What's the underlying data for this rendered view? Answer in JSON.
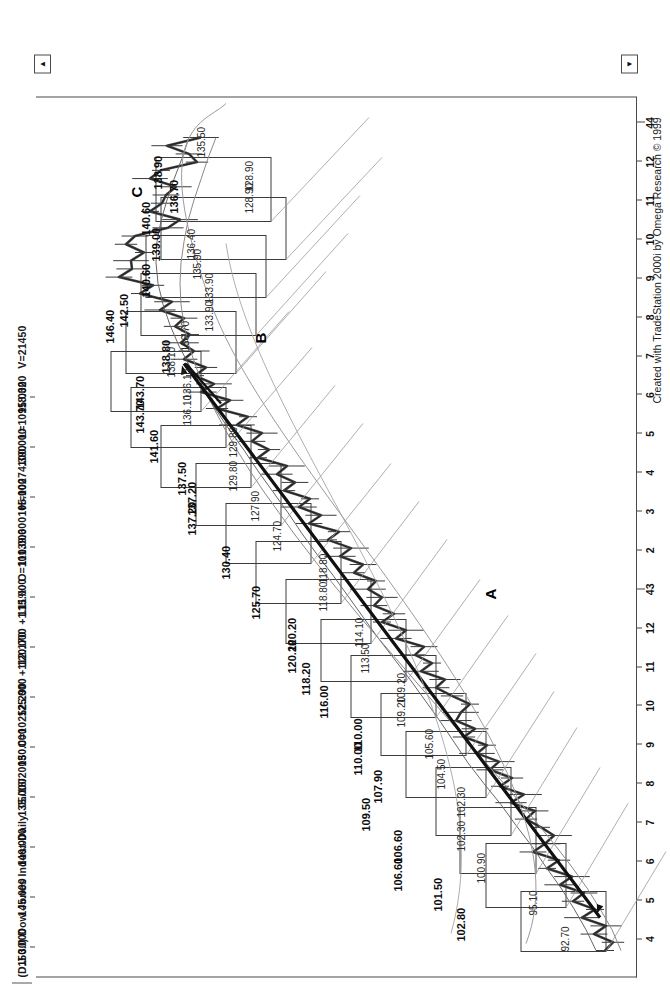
{
  "window": {
    "symbol": "(D.J 30) Dow Jones Indust-Daily",
    "date": "05/16/2005",
    "close": "C=10252.290",
    "change": "+112.170",
    "change_pct": "+1.11%",
    "open": "O=10139.600",
    "high": "H=10274.390",
    "low": "L=10118.320",
    "volume": "V=21450",
    "copyright": "Created with TradeStation 2000i by Omega Research © 1999",
    "scroll_up": "▲",
    "scroll_down": "▼"
  },
  "chart_data": {
    "type": "line",
    "title": "(D.J 30) Dow Jones Indust-Daily",
    "xlabel": "",
    "ylabel": "",
    "grid": false,
    "legend": "none",
    "ylim": [
      92.0,
      152.0
    ],
    "y_ticks": [
      "150.000",
      "145.000",
      "140.000",
      "135.000",
      "130.000",
      "125.000",
      "120.000",
      "115.000",
      "110.000",
      "105.000",
      "100.000",
      "95.000"
    ],
    "x_ticks": [
      "4",
      "5",
      "6",
      "7",
      "8",
      "9",
      "10",
      "11",
      "12",
      "43",
      "2",
      "3",
      "4",
      "5",
      "6",
      "7",
      "8",
      "9",
      "10",
      "11",
      "12",
      "44"
    ],
    "series": [
      {
        "name": "price",
        "x": [
          0,
          1,
          2,
          3,
          4,
          5,
          6,
          7,
          8,
          9,
          10,
          11,
          12,
          13,
          14,
          15,
          16,
          17,
          18,
          19,
          20,
          21,
          22,
          23,
          24,
          25,
          26,
          27,
          28,
          29,
          30,
          31,
          32,
          33,
          34,
          35,
          36,
          37,
          38,
          39,
          40,
          41,
          42,
          43,
          44,
          45,
          46,
          47,
          48,
          49,
          50,
          51,
          52,
          53,
          54,
          55,
          56,
          57,
          58,
          59,
          60,
          61,
          62,
          63,
          64,
          65,
          66,
          67,
          68,
          69,
          70,
          71,
          72,
          73,
          74,
          75,
          76,
          77,
          78,
          79,
          80,
          81,
          82,
          83,
          84,
          85,
          86,
          87,
          88,
          89,
          90,
          91,
          92,
          93,
          94,
          95,
          96,
          97,
          98,
          99
        ],
        "values": [
          95.1,
          94.3,
          96.2,
          95.0,
          97.4,
          96.1,
          98.3,
          97.2,
          99.6,
          98.4,
          100.9,
          99.7,
          102.3,
          101.1,
          100.2,
          101.5,
          103.0,
          102.1,
          104.5,
          103.2,
          105.6,
          104.4,
          106.6,
          105.7,
          107.9,
          106.9,
          109.2,
          108.1,
          110.0,
          109.5,
          108.6,
          110.4,
          112.0,
          111.1,
          113.5,
          112.4,
          114.1,
          113.2,
          116.0,
          115.0,
          117.4,
          116.2,
          118.2,
          117.4,
          118.8,
          118.0,
          120.2,
          119.3,
          121.6,
          120.5,
          122.8,
          121.7,
          124.7,
          123.5,
          125.7,
          124.6,
          127.2,
          126.1,
          127.9,
          126.9,
          129.8,
          128.7,
          130.4,
          129.4,
          131.9,
          130.8,
          133.9,
          132.6,
          135.5,
          134.2,
          136.1,
          135.0,
          137.2,
          136.2,
          137.5,
          136.6,
          138.1,
          137.2,
          139.6,
          138.4,
          141.6,
          140.3,
          143.7,
          142.4,
          142.5,
          141.2,
          143.0,
          142.1,
          138.8,
          137.6,
          140.6,
          139.4,
          139.0,
          138.0,
          140.6,
          139.5,
          135.9,
          136.7,
          138.9,
          135.5
        ]
      },
      {
        "name": "fast-ma",
        "values": [
          96.0,
          97.0,
          98.2,
          99.5,
          101.0,
          102.4,
          104.0,
          105.5,
          107.2,
          108.8,
          110.2,
          111.6,
          113.1,
          114.6,
          116.2,
          117.8,
          119.3,
          120.8,
          122.3,
          123.9,
          125.4,
          126.8,
          128.3,
          129.8,
          131.2,
          132.7,
          134.1,
          135.4,
          136.6,
          137.7,
          138.6,
          139.3,
          139.8,
          140.0,
          139.9,
          139.5,
          138.9,
          138.2,
          137.4,
          136.7
        ]
      },
      {
        "name": "slow-ma",
        "values": [
          93.5,
          94.4,
          95.6,
          96.9,
          98.4,
          100.0,
          101.7,
          103.4,
          105.2,
          107.0,
          108.8,
          110.6,
          112.4,
          114.2,
          116.0,
          117.8,
          119.6,
          121.3,
          123.0,
          124.6,
          126.2,
          127.7,
          129.2,
          130.6,
          131.9,
          133.1,
          134.2,
          135.2,
          136.0,
          136.7,
          137.2,
          137.5,
          137.6,
          137.5,
          137.2,
          136.8,
          136.2,
          135.5,
          134.8,
          134.0
        ]
      }
    ],
    "box_labels": [
      {
        "text": "102.80"
      },
      {
        "text": "101.50"
      },
      {
        "text": "106.60"
      },
      {
        "text": "106.60"
      },
      {
        "text": "109.50"
      },
      {
        "text": "107.90"
      },
      {
        "text": "110.00"
      },
      {
        "text": "110.00"
      },
      {
        "text": "116.00"
      },
      {
        "text": "118.20"
      },
      {
        "text": "120.20"
      },
      {
        "text": "120.20"
      },
      {
        "text": "125.70"
      },
      {
        "text": "130.40"
      },
      {
        "text": "137.20"
      },
      {
        "text": "137.20"
      },
      {
        "text": "137.50"
      },
      {
        "text": "141.60"
      },
      {
        "text": "143.70"
      },
      {
        "text": "143.70"
      },
      {
        "text": "138.80"
      },
      {
        "text": "146.40"
      },
      {
        "text": "142.50"
      },
      {
        "text": "140.60"
      },
      {
        "text": "139.00"
      },
      {
        "text": "140.60"
      },
      {
        "text": "136.70"
      },
      {
        "text": "138.90"
      }
    ],
    "level_labels": [
      {
        "text": "92.70"
      },
      {
        "text": "95.10"
      },
      {
        "text": "100.90"
      },
      {
        "text": "102.30"
      },
      {
        "text": "102.30"
      },
      {
        "text": "104.50"
      },
      {
        "text": "105.60"
      },
      {
        "text": "109.20"
      },
      {
        "text": "109.20"
      },
      {
        "text": "113.50"
      },
      {
        "text": "114.10"
      },
      {
        "text": "118.80"
      },
      {
        "text": "118.80"
      },
      {
        "text": "124.70"
      },
      {
        "text": "127.90"
      },
      {
        "text": "129.80"
      },
      {
        "text": "129.80"
      },
      {
        "text": "136.10"
      },
      {
        "text": "136.10"
      },
      {
        "text": "138.10"
      },
      {
        "text": "136.70"
      },
      {
        "text": "133.90"
      },
      {
        "text": "133.90"
      },
      {
        "text": "135.90"
      },
      {
        "text": "136.40"
      },
      {
        "text": "128.90"
      },
      {
        "text": "128.90"
      },
      {
        "text": "135.50"
      }
    ],
    "annotations": [
      {
        "label": "A",
        "note": "lower trendline pivot"
      },
      {
        "label": "B",
        "note": "mid trendline pivot"
      },
      {
        "label": "C",
        "note": "upper consolidation"
      }
    ]
  },
  "price_axis": [
    {
      "value": "150.000"
    },
    {
      "value": "145.000"
    },
    {
      "value": "140.000"
    },
    {
      "value": "135.000"
    },
    {
      "value": "130.000"
    },
    {
      "value": "125.000"
    },
    {
      "value": "120.000"
    },
    {
      "value": "115.000"
    },
    {
      "value": "110.000"
    },
    {
      "value": "105.000"
    },
    {
      "value": "100.000"
    },
    {
      "value": "95.000"
    }
  ],
  "date_axis": [
    {
      "label": "4"
    },
    {
      "label": "5"
    },
    {
      "label": "6"
    },
    {
      "label": "7"
    },
    {
      "label": "8"
    },
    {
      "label": "9"
    },
    {
      "label": "10"
    },
    {
      "label": "11"
    },
    {
      "label": "12"
    },
    {
      "label": "43"
    },
    {
      "label": "2"
    },
    {
      "label": "3"
    },
    {
      "label": "4"
    },
    {
      "label": "5"
    },
    {
      "label": "6"
    },
    {
      "label": "7"
    },
    {
      "label": "8"
    },
    {
      "label": "9"
    },
    {
      "label": "10"
    },
    {
      "label": "11"
    },
    {
      "label": "12"
    },
    {
      "label": "44"
    }
  ],
  "overlays": {
    "bold_labels": [
      {
        "t": "102.80",
        "x": 62,
        "y": 455
      },
      {
        "t": "101.50",
        "x": 92,
        "y": 432
      },
      {
        "t": "106.60",
        "x": 112,
        "y": 392
      },
      {
        "t": "106.60",
        "x": 140,
        "y": 392
      },
      {
        "t": "109.50",
        "x": 172,
        "y": 360
      },
      {
        "t": "107.90",
        "x": 200,
        "y": 372
      },
      {
        "t": "110.00",
        "x": 228,
        "y": 352
      },
      {
        "t": "110.00",
        "x": 252,
        "y": 352
      },
      {
        "t": "116.00",
        "x": 285,
        "y": 318
      },
      {
        "t": "118.20",
        "x": 308,
        "y": 300
      },
      {
        "t": "120.20",
        "x": 330,
        "y": 286
      },
      {
        "t": "120.20",
        "x": 352,
        "y": 286
      },
      {
        "t": "125.70",
        "x": 384,
        "y": 250
      },
      {
        "t": "130.40",
        "x": 424,
        "y": 220
      },
      {
        "t": "137.20",
        "x": 468,
        "y": 186
      },
      {
        "t": "137.20",
        "x": 488,
        "y": 186
      },
      {
        "t": "137.50",
        "x": 508,
        "y": 176
      },
      {
        "t": "141.60",
        "x": 540,
        "y": 148
      },
      {
        "t": "143.70",
        "x": 570,
        "y": 134
      },
      {
        "t": "143.70",
        "x": 594,
        "y": 134
      },
      {
        "t": "138.80",
        "x": 630,
        "y": 160
      },
      {
        "t": "146.40",
        "x": 660,
        "y": 104
      },
      {
        "t": "142.50",
        "x": 676,
        "y": 118
      },
      {
        "t": "140.60",
        "x": 706,
        "y": 140
      },
      {
        "t": "139.00",
        "x": 742,
        "y": 150
      },
      {
        "t": "140.60",
        "x": 768,
        "y": 140
      },
      {
        "t": "136.70",
        "x": 790,
        "y": 168
      },
      {
        "t": "138.90",
        "x": 814,
        "y": 152
      }
    ],
    "thin_labels": [
      {
        "t": "92.70",
        "x": 52,
        "y": 560
      },
      {
        "t": "95.10",
        "x": 88,
        "y": 528
      },
      {
        "t": "100.90",
        "x": 120,
        "y": 476
      },
      {
        "t": "102.30",
        "x": 152,
        "y": 456
      },
      {
        "t": "102.30",
        "x": 186,
        "y": 456
      },
      {
        "t": "104.50",
        "x": 214,
        "y": 436
      },
      {
        "t": "105.60",
        "x": 244,
        "y": 424
      },
      {
        "t": "109.20",
        "x": 276,
        "y": 396
      },
      {
        "t": "109.20",
        "x": 300,
        "y": 396
      },
      {
        "t": "113.50",
        "x": 330,
        "y": 360
      },
      {
        "t": "114.10",
        "x": 356,
        "y": 354
      },
      {
        "t": "118.80",
        "x": 392,
        "y": 318
      },
      {
        "t": "118.80",
        "x": 420,
        "y": 318
      },
      {
        "t": "124.70",
        "x": 452,
        "y": 272
      },
      {
        "t": "127.90",
        "x": 482,
        "y": 250
      },
      {
        "t": "129.80",
        "x": 512,
        "y": 228
      },
      {
        "t": "129.80",
        "x": 546,
        "y": 228
      },
      {
        "t": "136.10",
        "x": 578,
        "y": 182
      },
      {
        "t": "136.10",
        "x": 604,
        "y": 182
      },
      {
        "t": "138.10",
        "x": 626,
        "y": 166
      },
      {
        "t": "136.70",
        "x": 652,
        "y": 180
      },
      {
        "t": "133.90",
        "x": 672,
        "y": 204
      },
      {
        "t": "133.90",
        "x": 700,
        "y": 204
      },
      {
        "t": "135.90",
        "x": 724,
        "y": 192
      },
      {
        "t": "136.40",
        "x": 744,
        "y": 186
      },
      {
        "t": "128.90",
        "x": 790,
        "y": 244
      },
      {
        "t": "128.90",
        "x": 812,
        "y": 244
      },
      {
        "t": "135.50",
        "x": 846,
        "y": 196
      }
    ],
    "letters": [
      {
        "t": "A",
        "x": 404,
        "y": 482
      },
      {
        "t": "B",
        "x": 660,
        "y": 252
      },
      {
        "t": "C",
        "x": 806,
        "y": 128
      }
    ]
  }
}
